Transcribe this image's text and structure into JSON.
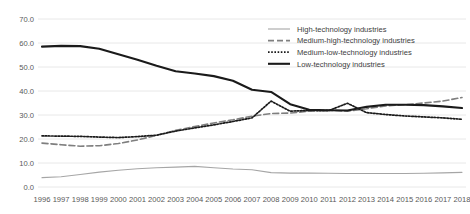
{
  "chart_data": {
    "type": "line",
    "title": "",
    "xlabel": "",
    "ylabel": "",
    "ylim": [
      0.0,
      70.0
    ],
    "yticks": [
      0.0,
      10.0,
      20.0,
      30.0,
      40.0,
      50.0,
      60.0,
      70.0
    ],
    "ytick_labels": [
      "0.0",
      "10.0",
      "20.0",
      "30.0",
      "40.0",
      "50.0",
      "60.0",
      "70.0"
    ],
    "grid": true,
    "legend_position": "top-right",
    "categories": [
      1996,
      1997,
      1998,
      1999,
      2000,
      2001,
      2002,
      2003,
      2004,
      2005,
      2006,
      2007,
      2008,
      2009,
      2010,
      2011,
      2012,
      2013,
      2014,
      2015,
      2016,
      2017,
      2018
    ],
    "xtick_labels": [
      "1996",
      "1997",
      "1998",
      "1999",
      "2000",
      "2001",
      "2002",
      "2003",
      "2004",
      "2005",
      "2006",
      "2007",
      "2008",
      "2009",
      "2010",
      "2011",
      "2012",
      "2013",
      "2014",
      "2015",
      "2016",
      "2017",
      "2018"
    ],
    "series": [
      {
        "name": "High-technology industries",
        "style": "solid-thin",
        "color": "#a6a6a6",
        "width": 1.1,
        "dash": "none",
        "values": [
          3.9,
          4.3,
          5.2,
          6.2,
          7.0,
          7.6,
          8.0,
          8.3,
          8.6,
          8.0,
          7.5,
          7.2,
          6.0,
          5.8,
          5.8,
          5.7,
          5.6,
          5.6,
          5.6,
          5.6,
          5.7,
          5.9,
          6.1
        ]
      },
      {
        "name": "Medium-high-technology industries",
        "style": "dashed",
        "color": "#7f7f7f",
        "width": 1.6,
        "dash": "6,3",
        "values": [
          18.3,
          17.6,
          17.0,
          17.2,
          18.1,
          19.6,
          21.5,
          23.6,
          25.2,
          26.7,
          28.0,
          29.5,
          30.6,
          30.8,
          31.6,
          32.0,
          31.6,
          32.6,
          33.8,
          34.3,
          35.0,
          35.8,
          37.3
        ]
      },
      {
        "name": "Medium-low-technology industries",
        "style": "dotted",
        "color": "#1a1a1a",
        "width": 1.7,
        "dash": "1.6,1.6",
        "values": [
          21.3,
          21.2,
          21.1,
          20.8,
          20.6,
          21.0,
          21.6,
          23.3,
          24.6,
          25.9,
          27.3,
          28.8,
          35.8,
          31.6,
          31.9,
          31.8,
          34.9,
          31.0,
          30.2,
          29.6,
          29.2,
          28.8,
          28.2
        ]
      },
      {
        "name": "Low-technology industries",
        "style": "solid-thick",
        "color": "#1a1a1a",
        "width": 2.1,
        "dash": "none",
        "values": [
          58.5,
          58.8,
          58.7,
          57.6,
          55.3,
          53.0,
          50.5,
          48.2,
          47.3,
          46.2,
          44.3,
          40.5,
          39.6,
          34.5,
          32.2,
          32.0,
          31.9,
          33.4,
          34.3,
          34.3,
          34.1,
          33.6,
          32.9
        ]
      }
    ]
  },
  "layout": {
    "plot_left": 42,
    "plot_right": 462,
    "plot_top": 19,
    "plot_bottom": 187,
    "legend_x": 268,
    "legend_text_x": 297,
    "legend_y_start": 29,
    "legend_row_height": 11.6,
    "xaxis_label_y": 202
  }
}
